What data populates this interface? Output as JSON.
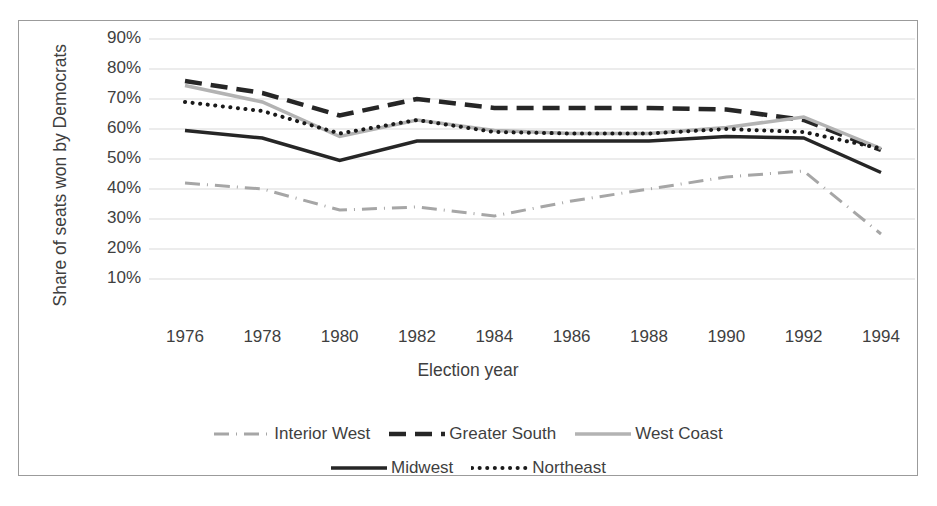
{
  "chart_data": {
    "type": "line",
    "title": "",
    "xlabel": "Election year",
    "ylabel": "Share of seats won by Democrats",
    "x": [
      1976,
      1978,
      1980,
      1982,
      1984,
      1986,
      1988,
      1990,
      1992,
      1994
    ],
    "xtick_labels": [
      "1976",
      "1978",
      "1980",
      "1982",
      "1984",
      "1986",
      "1988",
      "1990",
      "1992",
      "1994"
    ],
    "ytick_labels": [
      "90%",
      "80%",
      "70%",
      "60%",
      "50%",
      "40%",
      "30%",
      "20%",
      "10%"
    ],
    "ytick_values": [
      90,
      80,
      70,
      60,
      50,
      40,
      30,
      20,
      10
    ],
    "ylim": [
      5,
      95
    ],
    "xlim": [
      1975,
      1995
    ],
    "grid": "horizontal",
    "legend_position": "bottom",
    "series": [
      {
        "name": "Interior West",
        "style": "dash-dot",
        "color": "#a6a6a6",
        "width": 3,
        "values": [
          42,
          40,
          33,
          34,
          31,
          36,
          40,
          44,
          46,
          25
        ]
      },
      {
        "name": "Greater South",
        "style": "dashed",
        "color": "#262626",
        "width": 4.5,
        "values": [
          76,
          72,
          64.5,
          70,
          67,
          67,
          67,
          66.5,
          63,
          53
        ]
      },
      {
        "name": "West Coast",
        "style": "solid",
        "color": "#b3b3b3",
        "width": 3.5,
        "values": [
          74.5,
          69,
          57.5,
          63,
          59.5,
          58.5,
          58.5,
          60.5,
          64,
          53.5
        ]
      },
      {
        "name": "Midwest",
        "style": "solid",
        "color": "#262626",
        "width": 3.5,
        "values": [
          59.5,
          57,
          49.5,
          56,
          56,
          56,
          56,
          57.5,
          57,
          45.5
        ]
      },
      {
        "name": "Northeast",
        "style": "dotted",
        "color": "#1a1a1a",
        "width": 4,
        "values": [
          69,
          66,
          58.5,
          63,
          59,
          58.5,
          58.5,
          60,
          59,
          53.5
        ]
      }
    ]
  },
  "axis": {
    "y_title": "Share of seats won by Democrats",
    "x_title": "Election year"
  },
  "legend": {
    "rows": [
      [
        "Interior West",
        "Greater South",
        "West Coast"
      ],
      [
        "Midwest",
        "Northeast"
      ]
    ]
  },
  "colors": {
    "gridline": "#d9d9d9",
    "frame": "#9b9b9b",
    "text": "#3f3f3f",
    "dark_series": "#262626",
    "light_series": "#b3b3b3"
  }
}
